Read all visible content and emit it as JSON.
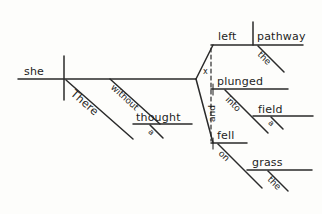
{
  "diagram": {
    "kind": "reed-kellogg-sentence-diagram",
    "sentence": "There without a thought she plunged into the left pathway and fell on the grass of a field",
    "ink_color": "#2a2a2a",
    "background_color": "#fdfdfb",
    "words": {
      "subject": "she",
      "adverb_there": "There",
      "prep_without": "without",
      "obj_thought": "thought",
      "art_a_thought": "a",
      "verb_plunged": "plunged",
      "prep_into": "into",
      "obj_field": "field",
      "art_a_field": "a",
      "adj_left": "left",
      "obj_pathway": "pathway",
      "art_the_pathway": "the",
      "conjunction": "and",
      "verb_fell": "fell",
      "prep_on": "on",
      "obj_grass": "grass",
      "art_the_grass": "the",
      "null_marker": "x"
    }
  }
}
